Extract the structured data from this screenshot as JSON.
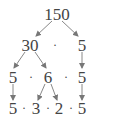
{
  "diagram": {
    "type": "factor-tree",
    "root": "150",
    "rows": [
      {
        "items": [
          "150"
        ]
      },
      {
        "items": [
          "30",
          "·",
          "5"
        ]
      },
      {
        "items": [
          "5",
          "·",
          "6",
          "·",
          "5"
        ]
      },
      {
        "items": [
          "5",
          "·",
          "3",
          "·",
          "2",
          "·",
          "5"
        ]
      }
    ],
    "dot": "·",
    "arrow_color": "#777777",
    "text_color": "#444444"
  }
}
